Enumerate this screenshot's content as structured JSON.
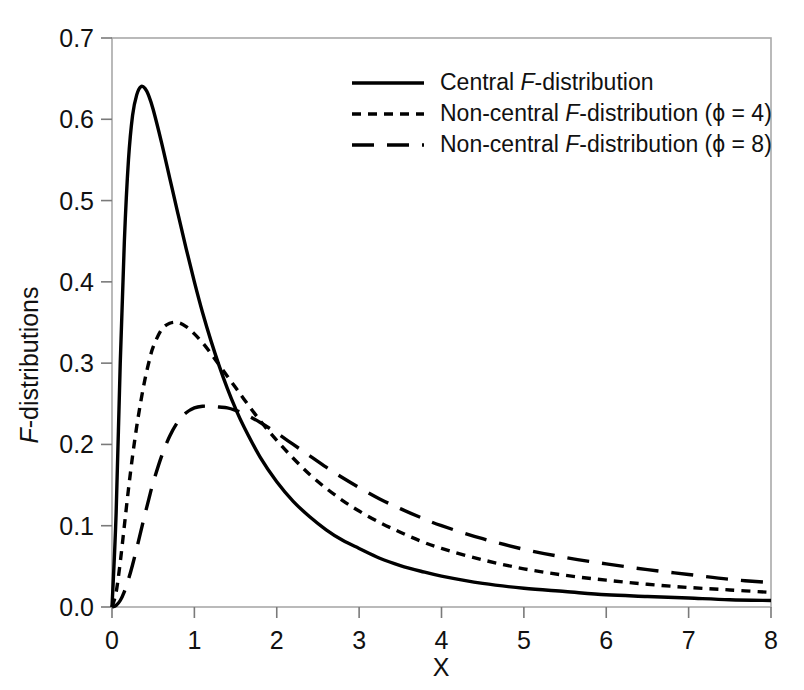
{
  "chart_data": {
    "type": "line",
    "title": "",
    "xlabel": "X",
    "ylabel": "F-distributions",
    "xlim": [
      0,
      8
    ],
    "ylim": [
      0.0,
      0.7
    ],
    "grid": false,
    "legend_position": "top-right",
    "xticks": [
      "0",
      "1",
      "2",
      "3",
      "4",
      "5",
      "6",
      "7",
      "8"
    ],
    "xtick_values": [
      0,
      1,
      2,
      3,
      4,
      5,
      6,
      7,
      8
    ],
    "yticks": [
      "0.0",
      "0.1",
      "0.2",
      "0.3",
      "0.4",
      "0.5",
      "0.6",
      "0.7"
    ],
    "ytick_values": [
      0.0,
      0.1,
      0.2,
      0.3,
      0.4,
      0.5,
      0.6,
      0.7
    ],
    "x": [
      0.0,
      0.05,
      0.1,
      0.15,
      0.2,
      0.25,
      0.3,
      0.35,
      0.4,
      0.45,
      0.5,
      0.6,
      0.7,
      0.8,
      0.9,
      1.0,
      1.1,
      1.2,
      1.3,
      1.4,
      1.5,
      1.6,
      1.8,
      2.0,
      2.2,
      2.4,
      2.6,
      2.8,
      3.0,
      3.25,
      3.5,
      3.75,
      4.0,
      4.5,
      5.0,
      5.5,
      6.0,
      6.5,
      7.0,
      7.5,
      8.0
    ],
    "series": [
      {
        "name": "Central F-distribution",
        "style": "solid",
        "values": [
          0.0,
          0.115,
          0.3,
          0.45,
          0.55,
          0.605,
          0.63,
          0.64,
          0.638,
          0.628,
          0.612,
          0.572,
          0.528,
          0.484,
          0.441,
          0.4,
          0.362,
          0.328,
          0.297,
          0.269,
          0.244,
          0.222,
          0.184,
          0.154,
          0.13,
          0.111,
          0.095,
          0.082,
          0.072,
          0.06,
          0.051,
          0.044,
          0.038,
          0.029,
          0.023,
          0.019,
          0.015,
          0.013,
          0.011,
          0.009,
          0.008
        ]
      },
      {
        "name": "Non-central F-distribution (ϕ = 4)",
        "style": "dotted",
        "values": [
          0.0,
          0.018,
          0.055,
          0.1,
          0.145,
          0.186,
          0.222,
          0.253,
          0.28,
          0.302,
          0.32,
          0.341,
          0.349,
          0.35,
          0.345,
          0.336,
          0.325,
          0.312,
          0.298,
          0.284,
          0.27,
          0.256,
          0.229,
          0.205,
          0.183,
          0.163,
          0.146,
          0.131,
          0.118,
          0.104,
          0.092,
          0.081,
          0.072,
          0.058,
          0.047,
          0.039,
          0.033,
          0.028,
          0.024,
          0.021,
          0.018
        ]
      },
      {
        "name": "Non-central F-distribution (ϕ = 8)",
        "style": "dashed",
        "values": [
          0.0,
          0.002,
          0.008,
          0.019,
          0.034,
          0.052,
          0.072,
          0.093,
          0.114,
          0.134,
          0.153,
          0.185,
          0.21,
          0.228,
          0.239,
          0.245,
          0.247,
          0.247,
          0.246,
          0.245,
          0.242,
          0.238,
          0.227,
          0.214,
          0.2,
          0.186,
          0.172,
          0.159,
          0.147,
          0.133,
          0.121,
          0.11,
          0.1,
          0.084,
          0.071,
          0.061,
          0.053,
          0.046,
          0.04,
          0.034,
          0.03
        ]
      }
    ],
    "annotations": []
  },
  "legend": {
    "items": [
      {
        "style": "solid",
        "prefix": "Central ",
        "italic": "F",
        "suffix": "-distribution"
      },
      {
        "style": "dotted",
        "prefix": "Non-central ",
        "italic": "F",
        "suffix": "-distribution (ϕ = 4)"
      },
      {
        "style": "dashed",
        "prefix": "Non-central ",
        "italic": "F",
        "suffix": "-distribution (ϕ = 8)"
      }
    ]
  },
  "axes": {
    "ylabel_italic": "F",
    "ylabel_rest": "-distributions",
    "xlabel": "X"
  },
  "colors": {
    "curve": "#000000",
    "frame": "#a9a9a9",
    "tick": "#7a7a7a",
    "text": "#111111",
    "background": "#ffffff"
  }
}
